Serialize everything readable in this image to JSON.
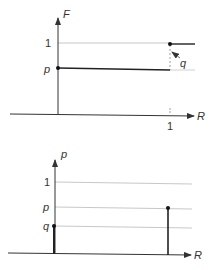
{
  "top_panel": {
    "y_axis_label": "F",
    "x_axis_label": "R",
    "y_ticks": [
      "1",
      "p"
    ],
    "x_ticks": [
      "1"
    ],
    "annotation": "q",
    "description": "Cumulative distribution F(R): value p for 0 <= R < 1, jumps to 1 at R = 1; jump size q"
  },
  "bottom_panel": {
    "y_axis_label": "p",
    "x_axis_label": "R",
    "y_ticks": [
      "1",
      "p",
      "q"
    ],
    "description": "Probability mass function: mass q at R = 0, mass p at R = 1"
  },
  "colors": {
    "axis": "#333333",
    "grid": "#c8c8c8",
    "step": "#222222"
  }
}
